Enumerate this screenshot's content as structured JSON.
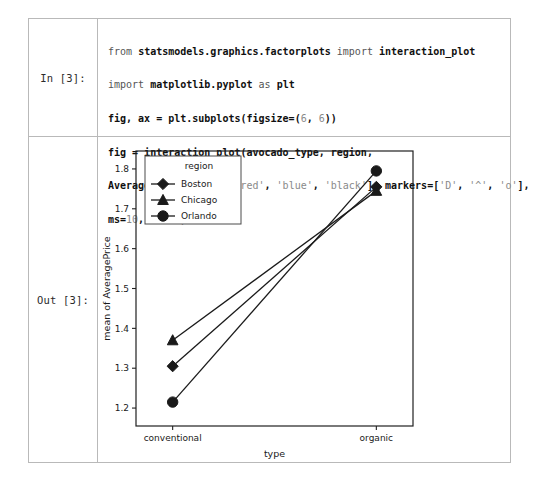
{
  "notebook": {
    "input_prompt": "In [3]:",
    "output_prompt": "Out [3]:",
    "code_lines": [
      "from statsmodels.graphics.factorplots import interaction_plot",
      "import matplotlib.pyplot as plt",
      "fig, ax = plt.subplots(figsize=(6, 6))",
      "fig = interaction_plot(avocado_type, region,",
      "AveragePrice,colors=['red', 'blue', 'black'], markers=['D', '^', 'o'],",
      "ms=10, ax=ax)"
    ],
    "code_tokens": {
      "l1_kw_from": "from",
      "l1_module": "statsmodels.graphics.factorplots",
      "l1_kw_import": "import",
      "l1_target": "interaction_plot",
      "l2_kw_import": "import",
      "l2_module": "matplotlib.pyplot",
      "l2_kw_as": "as",
      "l2_alias": "plt",
      "l3_a": "fig, ax = plt.subplots(figsize=(",
      "l3_n1": "6",
      "l3_comma": ", ",
      "l3_n2": "6",
      "l3_b": "))",
      "l4": "fig = interaction_plot(avocado_type, region,",
      "l5_a": "AveragePrice,colors=[",
      "l5_s1": "'red'",
      "l5_c1": ", ",
      "l5_s2": "'blue'",
      "l5_c2": ", ",
      "l5_s3": "'black'",
      "l5_b": "], markers=[",
      "l5_s4": "'D'",
      "l5_c3": ", ",
      "l5_s5": "'^'",
      "l5_c4": ", ",
      "l5_s6": "'o'",
      "l5_c": "],",
      "l6_a": "ms=",
      "l6_n": "10",
      "l6_b": ", ax=ax)"
    }
  },
  "chart_data": {
    "type": "line",
    "title": "",
    "xlabel": "type",
    "ylabel": "mean of AveragePrice",
    "categories": [
      "conventional",
      "organic"
    ],
    "x": [
      0,
      1
    ],
    "xlim": [
      -0.18,
      1.18
    ],
    "ylim": [
      1.155,
      1.845
    ],
    "yticks": [
      1.2,
      1.3,
      1.4,
      1.5,
      1.6,
      1.7,
      1.8
    ],
    "ytick_labels": [
      "1.2",
      "1.3",
      "1.4",
      "1.5",
      "1.6",
      "1.7",
      "1.8"
    ],
    "xtick_labels": [
      "conventional",
      "organic"
    ],
    "grid": false,
    "legend": {
      "title": "region",
      "position": "upper left",
      "entries": [
        {
          "name": "Boston",
          "marker": "diamond",
          "color": "#1a1a1a"
        },
        {
          "name": "Chicago",
          "marker": "triangle",
          "color": "#1a1a1a"
        },
        {
          "name": "Orlando",
          "marker": "circle",
          "color": "#1a1a1a"
        }
      ]
    },
    "series": [
      {
        "name": "Boston",
        "marker": "diamond",
        "color": "#1a1a1a",
        "values": [
          1.305,
          1.755
        ]
      },
      {
        "name": "Chicago",
        "marker": "triangle",
        "color": "#1a1a1a",
        "values": [
          1.37,
          1.745
        ]
      },
      {
        "name": "Orlando",
        "marker": "circle",
        "color": "#1a1a1a",
        "values": [
          1.215,
          1.795
        ]
      }
    ]
  }
}
